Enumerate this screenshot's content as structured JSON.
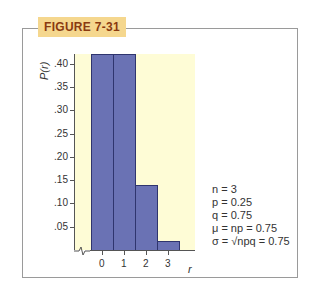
{
  "figure_label": "FIGURE 7-31",
  "chart_data": {
    "type": "bar",
    "title": "",
    "xlabel": "r",
    "ylabel": "P(r)",
    "categories": [
      "0",
      "1",
      "2",
      "3"
    ],
    "values": [
      0.42,
      0.42,
      0.14,
      0.02
    ],
    "yticks": [
      ".05",
      ".10",
      ".15",
      ".20",
      ".25",
      ".30",
      ".35",
      ".40"
    ],
    "ylim": [
      0,
      0.42
    ],
    "grid": false,
    "legend": "none",
    "annotations": [
      "n = 3",
      "p = 0.25",
      "q = 0.75",
      "μ = np = 0.75",
      "σ = √npq = 0.75"
    ]
  },
  "stats": {
    "n": "n = 3",
    "p": "p = 0.25",
    "q": "q = 0.75",
    "mu": "μ = np = 0.75",
    "sigma": "σ = √npq = 0.75"
  },
  "colors": {
    "bar_fill": "#6a72b4",
    "plot_background": "#fefcd6",
    "label_background": "#f5d78e"
  }
}
